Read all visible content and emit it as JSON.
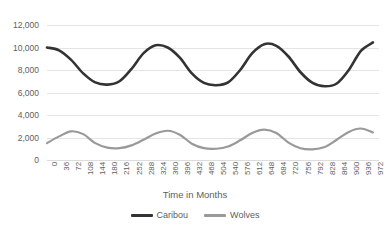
{
  "chart_data": {
    "type": "line",
    "title": "",
    "subtitle": "",
    "xlabel": "Time in Months",
    "ylabel": "",
    "xlim": [
      0,
      990
    ],
    "ylim": [
      0,
      12000
    ],
    "grid": true,
    "legend_position": "bottom",
    "y_ticks": [
      "0",
      "2,000",
      "4,000",
      "6,000",
      "8,000",
      "10,000",
      "12,000"
    ],
    "y_tick_values": [
      0,
      2000,
      4000,
      6000,
      8000,
      10000,
      12000
    ],
    "x_ticks": [
      "0",
      "36",
      "72",
      "108",
      "144",
      "180",
      "216",
      "252",
      "288",
      "324",
      "360",
      "396",
      "432",
      "468",
      "504",
      "540",
      "576",
      "612",
      "648",
      "684",
      "720",
      "756",
      "792",
      "828",
      "864",
      "900",
      "936",
      "972"
    ],
    "x_tick_values": [
      0,
      36,
      72,
      108,
      144,
      180,
      216,
      252,
      288,
      324,
      360,
      396,
      432,
      468,
      504,
      540,
      576,
      612,
      648,
      684,
      720,
      756,
      792,
      828,
      864,
      900,
      936,
      972
    ],
    "colors": {
      "caribou": "#333333",
      "wolves": "#999999",
      "gridline": "#e4e4e4",
      "text": "#5e5e5e",
      "background": "#ffffff"
    },
    "series": [
      {
        "name": "Caribou",
        "color": "#333333",
        "line_width": 2.6,
        "x": [
          0,
          36,
          72,
          108,
          144,
          180,
          216,
          252,
          288,
          324,
          360,
          396,
          432,
          468,
          504,
          540,
          576,
          612,
          648,
          684,
          720,
          756,
          792,
          828,
          864,
          900,
          936,
          972
        ],
        "values": [
          10000,
          9750,
          8900,
          7700,
          6900,
          6700,
          7000,
          8100,
          9500,
          10200,
          10000,
          9100,
          7700,
          6850,
          6650,
          6900,
          8000,
          9500,
          10300,
          10150,
          9200,
          7800,
          6850,
          6550,
          6800,
          8000,
          9700,
          10450
        ]
      },
      {
        "name": "Wolves",
        "color": "#999999",
        "line_width": 2.2,
        "x": [
          0,
          36,
          72,
          108,
          144,
          180,
          216,
          252,
          288,
          324,
          360,
          396,
          432,
          468,
          504,
          540,
          576,
          612,
          648,
          684,
          720,
          756,
          792,
          828,
          864,
          900,
          936,
          972
        ],
        "values": [
          1500,
          2100,
          2550,
          2300,
          1500,
          1100,
          1050,
          1300,
          1800,
          2350,
          2600,
          2250,
          1450,
          1050,
          1000,
          1200,
          1750,
          2400,
          2700,
          2400,
          1550,
          1050,
          950,
          1150,
          1800,
          2500,
          2800,
          2450
        ]
      }
    ]
  },
  "legend": {
    "entries": [
      {
        "label": "Caribou",
        "color": "#333333"
      },
      {
        "label": "Wolves",
        "color": "#999999"
      }
    ]
  },
  "axis_title": {
    "x": "Time in Months"
  }
}
